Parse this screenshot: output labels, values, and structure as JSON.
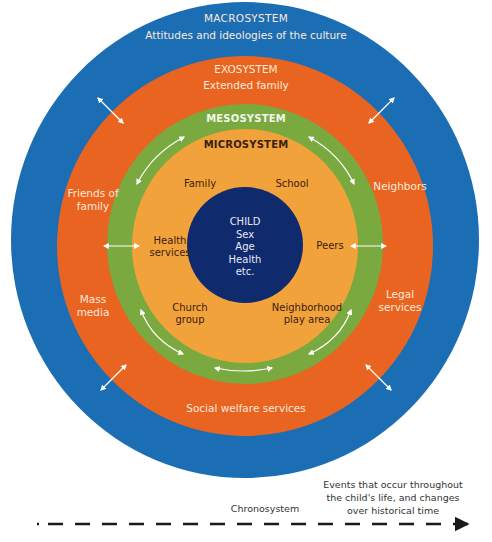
{
  "colors": {
    "macro": "#1b6db4",
    "exo": "#ea6421",
    "meso": "#79a93f",
    "micro": "#f2a23a",
    "child": "#0f2a6d",
    "arrow": "#ffffff",
    "timeline": "#1a1a1a"
  },
  "macrosystem": {
    "title": "MACROSYSTEM",
    "description": "Attitudes and ideologies of the culture"
  },
  "exosystem": {
    "title": "EXOSYSTEM",
    "items": {
      "top": "Extended family",
      "friends_1": "Friends of",
      "friends_2": "family",
      "neighbors": "Neighbors",
      "mass_1": "Mass",
      "mass_2": "media",
      "legal_1": "Legal",
      "legal_2": "services",
      "bottom": "Social welfare services"
    }
  },
  "mesosystem": {
    "title": "MESOSYSTEM"
  },
  "microsystem": {
    "title": "MICROSYSTEM",
    "items": {
      "family": "Family",
      "school": "School",
      "health_1": "Health",
      "health_2": "services",
      "peers": "Peers",
      "church_1": "Church",
      "church_2": "group",
      "neighborhood_1": "Neighborhood",
      "neighborhood_2": "play area"
    }
  },
  "child": {
    "lines": [
      "CHILD",
      "Sex",
      "Age",
      "Health",
      "etc."
    ]
  },
  "chronosystem": {
    "label": "Chronosystem",
    "description_lines": [
      "Events that occur throughout",
      "the child's life, and changes",
      "over historical time"
    ]
  }
}
